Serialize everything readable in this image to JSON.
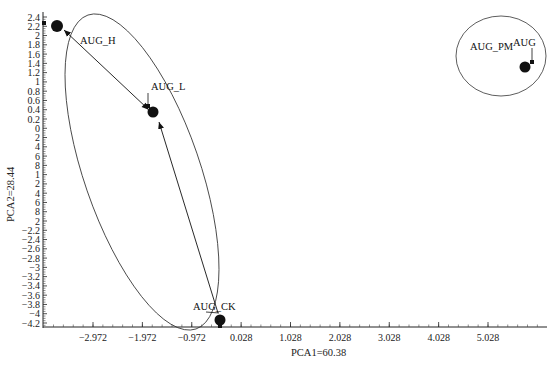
{
  "chart_data": {
    "type": "scatter",
    "title": "",
    "xlabel": "PCA1=60.38",
    "ylabel": "PCA2=28.44",
    "xlim": [
      -3.972,
      6.2
    ],
    "ylim": [
      -4.3,
      2.5
    ],
    "grid": false,
    "legend": null,
    "x_ticks": [
      "-2.972",
      "-1.972",
      "-0.972",
      "0.028",
      "1.028",
      "2.028",
      "3.028",
      "4.028",
      "5.028"
    ],
    "x_tick_values": [
      -2.972,
      -1.972,
      -0.972,
      0.028,
      1.028,
      2.028,
      3.028,
      4.028,
      5.028
    ],
    "y_ticks": [
      "2.4",
      "2.2",
      "2",
      "1.8",
      "1.6",
      "1.4",
      "1.2",
      "1",
      "0.8",
      "0.6",
      "0.4",
      "0.2",
      "0",
      "2",
      "4",
      "6",
      "8",
      "1",
      "2",
      "4",
      "6",
      "8",
      "2",
      "-2.2",
      "-2.4",
      "-2.6",
      "-2.8",
      "-3",
      "-3.2",
      "-3.4",
      "-3.6",
      "-3.8",
      "-4",
      "-4.2"
    ],
    "y_tick_values": [
      2.4,
      2.2,
      2.0,
      1.8,
      1.6,
      1.4,
      1.2,
      1.0,
      0.8,
      0.6,
      0.4,
      0.2,
      0.0,
      -0.2,
      -0.4,
      -0.6,
      -0.8,
      -1.0,
      -1.2,
      -1.4,
      -1.6,
      -1.8,
      -2.0,
      -2.2,
      -2.4,
      -2.6,
      -2.8,
      -3.0,
      -3.2,
      -3.4,
      -3.6,
      -3.8,
      -4.0,
      -4.2
    ],
    "points": [
      {
        "label": "AUG_H",
        "x": -3.7,
        "y": 2.2
      },
      {
        "label": "AUG_L",
        "x": -1.76,
        "y": 0.35
      },
      {
        "label": "AUG_CK",
        "x": -0.42,
        "y": -4.1
      },
      {
        "label": "AUG_PM",
        "x": 5.7,
        "y": 1.4
      },
      {
        "label": "AUG",
        "x": 5.75,
        "y": 1.45
      }
    ],
    "arrows": [
      {
        "from": "AUG_L",
        "to": "AUG_H",
        "bidirectional": true
      },
      {
        "from": "AUG_CK",
        "to": "AUG_L"
      }
    ],
    "clusters": [
      {
        "name": "group-1",
        "members": [
          "AUG_H",
          "AUG_L",
          "AUG_CK"
        ],
        "shape": "ellipse"
      },
      {
        "name": "group-2",
        "members": [
          "AUG_PM",
          "AUG"
        ],
        "shape": "ellipse"
      }
    ],
    "annotations": [
      "AUG_H",
      "AUG_L",
      "AUG_CK",
      "AUG_PM",
      "AUG"
    ],
    "caption": ""
  },
  "labels": {
    "xlabel": "PCA1=60.38",
    "ylabel": "PCA2=28.44",
    "aug_h": "AUG_H",
    "aug_l": "AUG_L",
    "aug_ck": "AUG_CK",
    "aug_pm": "AUG_PM",
    "aug": "AUG"
  },
  "y_labels": [
    "2.4",
    "2.2",
    "2",
    "1.8",
    "1.6",
    "1.4",
    "1.2",
    "1",
    "0.8",
    "0.6",
    "0.4",
    "0.2",
    "0",
    "2",
    "4",
    "6",
    "8",
    "1",
    "2",
    "4",
    "6",
    "8",
    "2",
    "-2.2",
    "-2.4",
    "-2.6",
    "-2.8",
    "-3",
    "-3.2",
    "-3.4",
    "-3.6",
    "-3.8",
    "-4",
    "-4.2"
  ],
  "x_labels": [
    "-2.972",
    "-1.972",
    "-0.972",
    "0.028",
    "1.028",
    "2.028",
    "3.028",
    "4.028",
    "5.028"
  ],
  "colors": {
    "ink": "#111111",
    "axis": "#222222",
    "background": "#ffffff"
  }
}
